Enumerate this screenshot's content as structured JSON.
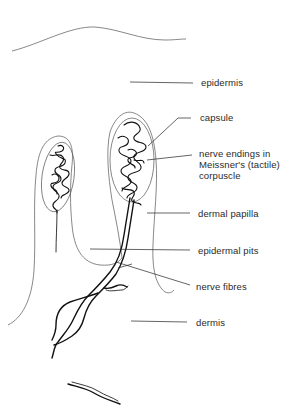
{
  "diagram": {
    "labels": [
      {
        "id": "epidermis",
        "text": "epidermis"
      },
      {
        "id": "capsule",
        "text": "capsule"
      },
      {
        "id": "nerve_endings",
        "text": "nerve endings in\nMeissner's (tactile)\ncorpuscle"
      },
      {
        "id": "dermal_papilla",
        "text": "dermal papilla"
      },
      {
        "id": "epidermal_pits",
        "text": "epidermal pits"
      },
      {
        "id": "nerve_fibres",
        "text": "nerve fibres"
      },
      {
        "id": "dermis",
        "text": "dermis"
      }
    ],
    "colors": {
      "background": "#ffffff",
      "line": "#222222",
      "text": "#2a2a2a"
    }
  }
}
